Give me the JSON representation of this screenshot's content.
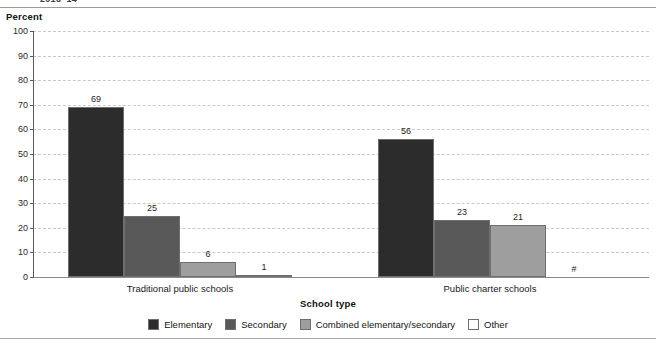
{
  "figure": {
    "top_title_partial": "2013–14",
    "y_axis_unit_label": "Percent",
    "x_axis_title": "School type",
    "footnote_symbol": "#"
  },
  "chart_data": {
    "type": "bar",
    "title": "2013–14",
    "xlabel": "School type",
    "ylabel": "Percent",
    "ylim": [
      0,
      100
    ],
    "ytick_step": 10,
    "yticks": [
      0,
      10,
      20,
      30,
      40,
      50,
      60,
      70,
      80,
      90,
      100
    ],
    "ytick_labels": [
      "0",
      "10",
      "20",
      "30",
      "40",
      "50",
      "60",
      "70",
      "80",
      "90",
      "100"
    ],
    "grid": "horizontal-dashed",
    "legend_position": "bottom-center",
    "categories": [
      "Traditional public schools",
      "Public charter schools"
    ],
    "series": [
      {
        "name": "Elementary",
        "color": "#2c2c2c",
        "values": [
          69,
          56
        ],
        "labels": [
          "69",
          "56"
        ]
      },
      {
        "name": "Secondary",
        "color": "#595959",
        "values": [
          25,
          23
        ],
        "labels": [
          "25",
          "23"
        ]
      },
      {
        "name": "Combined elementary/secondary",
        "color": "#9e9e9e",
        "values": [
          6,
          21
        ],
        "labels": [
          "6",
          "21"
        ]
      },
      {
        "name": "Other",
        "color": "#ffffff",
        "values": [
          1,
          0
        ],
        "labels": [
          "1",
          "#"
        ]
      }
    ]
  },
  "legend": {
    "items": [
      {
        "label": "Elementary",
        "color": "#2c2c2c"
      },
      {
        "label": "Secondary",
        "color": "#595959"
      },
      {
        "label": "Combined elementary/secondary",
        "color": "#9e9e9e"
      },
      {
        "label": "Other",
        "color": "#ffffff"
      }
    ]
  }
}
